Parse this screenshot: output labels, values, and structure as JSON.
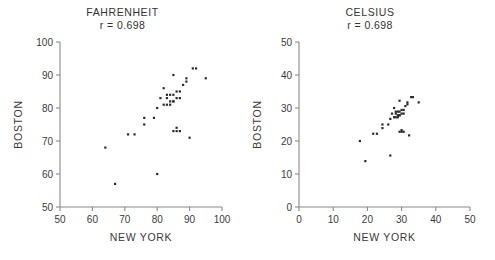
{
  "figure": {
    "width": 495,
    "height": 260,
    "background": "#ffffff",
    "point_color": "#2b2b2b",
    "axis_color": "#8a8a8a"
  },
  "chart_data": [
    {
      "type": "scatter",
      "id": "fahrenheit",
      "title": "FAHRENHEIT",
      "subtitle": "r = 0.698",
      "correlation": 0.698,
      "xlabel": "NEW YORK",
      "ylabel": "BOSTON",
      "xlim": [
        50,
        100
      ],
      "ylim": [
        50,
        100
      ],
      "xticks": [
        50,
        60,
        70,
        80,
        90,
        100
      ],
      "yticks": [
        50,
        60,
        70,
        80,
        90,
        100
      ],
      "grid": false,
      "legend": null,
      "units": "degrees Fahrenheit",
      "n_points": 37,
      "points": [
        [
          64,
          68
        ],
        [
          67,
          57
        ],
        [
          71,
          72
        ],
        [
          73,
          72
        ],
        [
          76,
          75
        ],
        [
          76,
          77
        ],
        [
          79,
          77
        ],
        [
          80,
          60
        ],
        [
          80,
          80
        ],
        [
          81,
          83
        ],
        [
          82,
          86
        ],
        [
          82,
          81
        ],
        [
          83,
          81
        ],
        [
          83,
          84
        ],
        [
          83,
          83
        ],
        [
          84,
          84
        ],
        [
          84,
          81
        ],
        [
          84,
          82
        ],
        [
          85,
          84
        ],
        [
          85,
          82
        ],
        [
          85,
          82
        ],
        [
          85,
          90
        ],
        [
          85,
          73
        ],
        [
          86,
          85
        ],
        [
          86,
          83
        ],
        [
          86,
          73
        ],
        [
          86,
          74
        ],
        [
          87,
          85
        ],
        [
          87,
          83
        ],
        [
          87,
          73
        ],
        [
          88,
          87
        ],
        [
          89,
          89
        ],
        [
          89,
          88
        ],
        [
          90,
          71
        ],
        [
          91,
          92
        ],
        [
          92,
          92
        ],
        [
          95,
          89
        ]
      ]
    },
    {
      "type": "scatter",
      "id": "celsius",
      "title": "CELSIUS",
      "subtitle": "r = 0.698",
      "correlation": 0.698,
      "xlabel": "NEW YORK",
      "ylabel": "BOSTON",
      "xlim": [
        0,
        50
      ],
      "ylim": [
        0,
        50
      ],
      "xticks": [
        0,
        10,
        20,
        30,
        40,
        50
      ],
      "yticks": [
        0,
        10,
        20,
        30,
        40,
        50
      ],
      "grid": false,
      "legend": null,
      "units": "degrees Celsius",
      "n_points": 37,
      "points": [
        [
          17.8,
          20.0
        ],
        [
          19.4,
          13.9
        ],
        [
          21.7,
          22.2
        ],
        [
          22.8,
          22.2
        ],
        [
          24.4,
          23.9
        ],
        [
          24.4,
          25.0
        ],
        [
          26.1,
          25.0
        ],
        [
          26.7,
          15.6
        ],
        [
          26.7,
          26.7
        ],
        [
          27.2,
          28.3
        ],
        [
          27.8,
          30.0
        ],
        [
          27.8,
          27.2
        ],
        [
          28.3,
          27.2
        ],
        [
          28.3,
          28.9
        ],
        [
          28.3,
          28.3
        ],
        [
          28.9,
          28.9
        ],
        [
          28.9,
          27.2
        ],
        [
          28.9,
          27.8
        ],
        [
          29.4,
          28.9
        ],
        [
          29.4,
          27.8
        ],
        [
          29.4,
          27.8
        ],
        [
          29.4,
          32.2
        ],
        [
          29.4,
          22.8
        ],
        [
          30.0,
          29.4
        ],
        [
          30.0,
          28.3
        ],
        [
          30.0,
          22.8
        ],
        [
          30.0,
          23.3
        ],
        [
          30.6,
          29.4
        ],
        [
          30.6,
          28.3
        ],
        [
          30.6,
          22.8
        ],
        [
          31.1,
          30.6
        ],
        [
          31.7,
          31.7
        ],
        [
          31.7,
          31.1
        ],
        [
          32.2,
          21.7
        ],
        [
          32.8,
          33.3
        ],
        [
          33.3,
          33.3
        ],
        [
          35.0,
          31.7
        ]
      ]
    }
  ]
}
